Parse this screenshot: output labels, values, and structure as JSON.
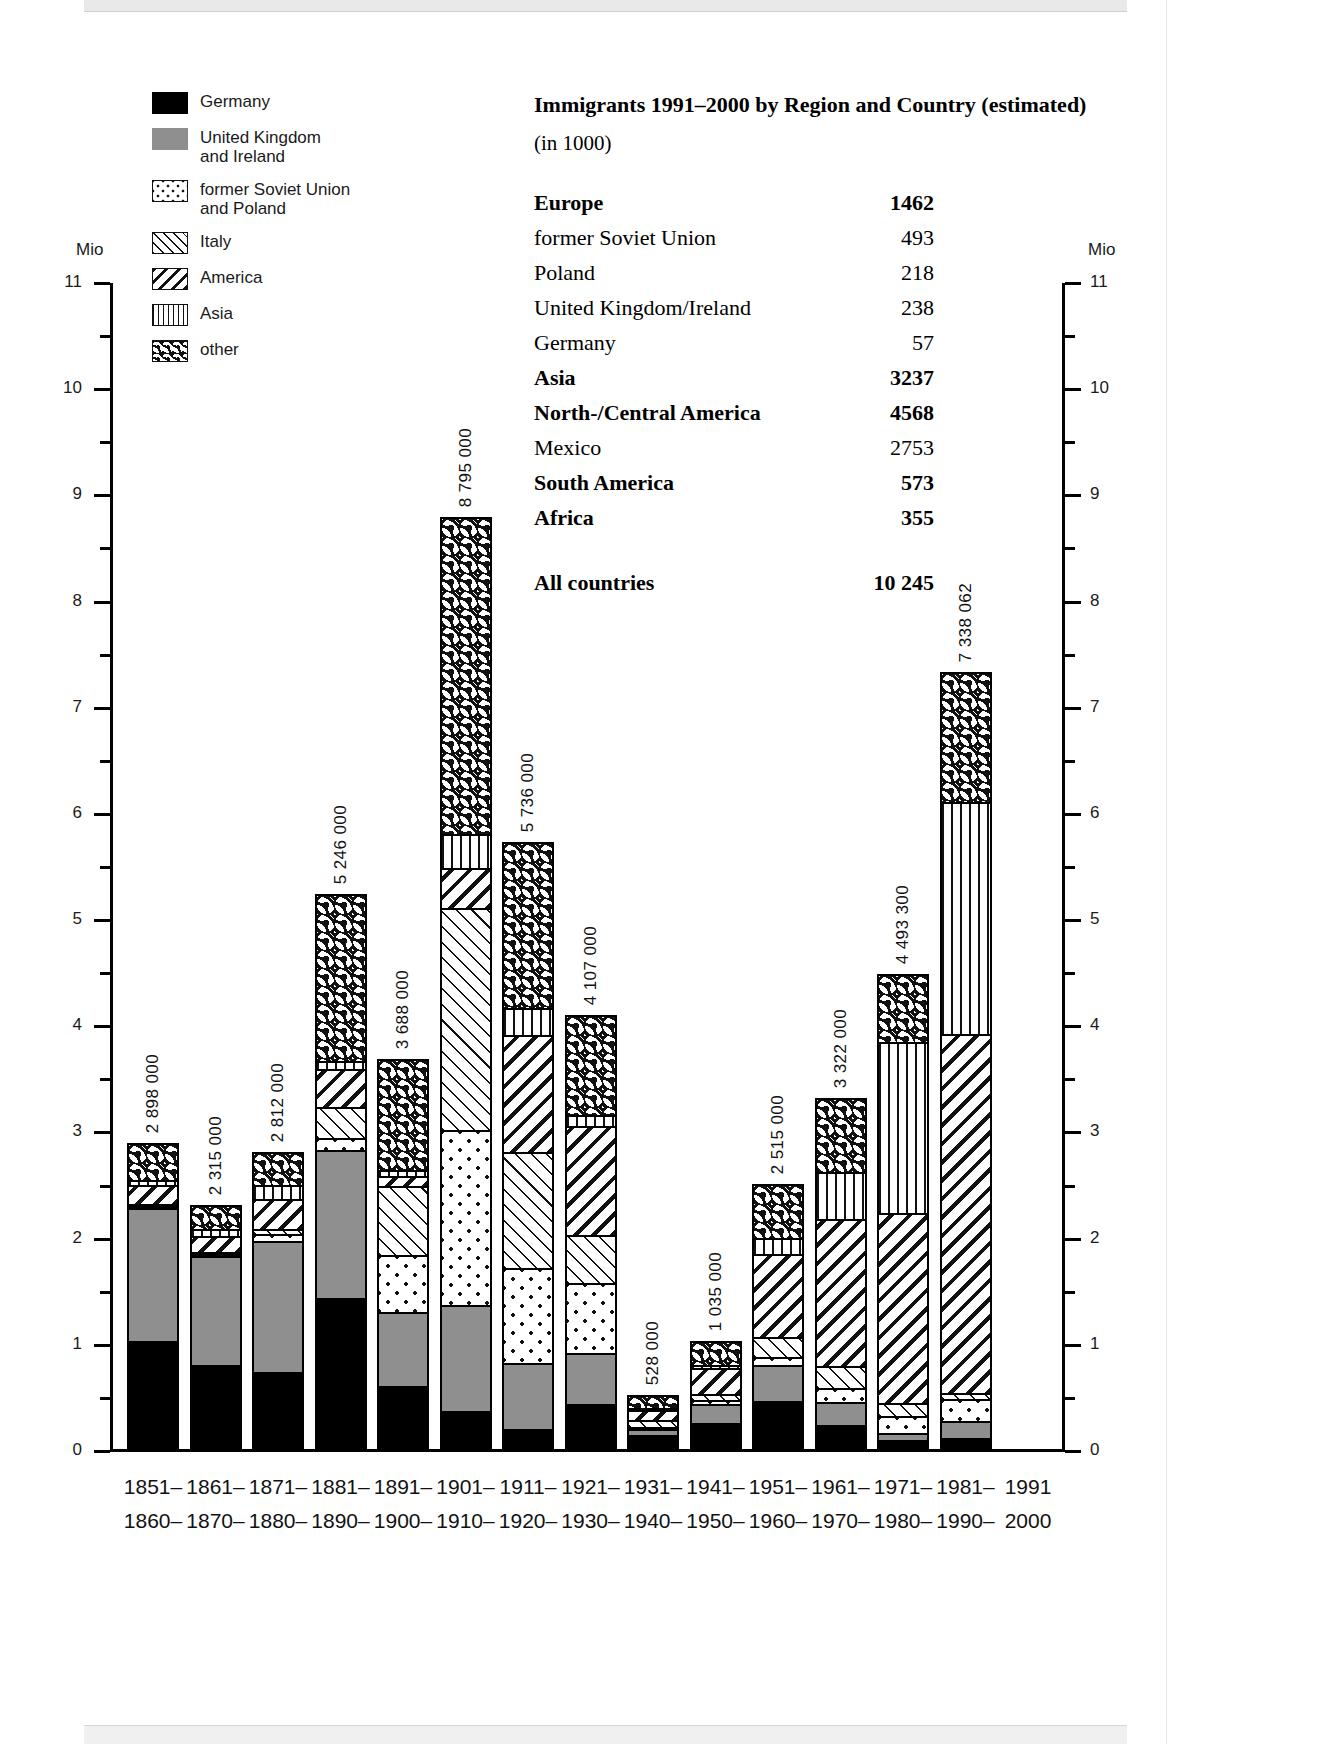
{
  "legend": {
    "items": [
      {
        "label": "Germany",
        "pattern": "solid-black",
        "key": "germany"
      },
      {
        "label": "United Kingdom\nand Ireland",
        "pattern": "solid-grey",
        "key": "uk"
      },
      {
        "label": "former Soviet Union\nand Poland",
        "pattern": "dotted",
        "key": "soviet"
      },
      {
        "label": "Italy",
        "pattern": "fine-diagonal-hatch",
        "key": "italy"
      },
      {
        "label": "America",
        "pattern": "bold-diagonal-hatch",
        "key": "america"
      },
      {
        "label": "Asia",
        "pattern": "vertical-lines",
        "key": "asia"
      },
      {
        "label": "other",
        "pattern": "wavy",
        "key": "other"
      }
    ]
  },
  "table": {
    "title": "Immigrants 1991–2000 by Region and Country (estimated)",
    "subtitle": "(in 1000)",
    "rows": [
      {
        "name": "Europe",
        "value": "1462",
        "bold": true
      },
      {
        "name": "former Soviet Union",
        "value": "493",
        "bold": false
      },
      {
        "name": "Poland",
        "value": "218",
        "bold": false
      },
      {
        "name": "United Kingdom/Ireland",
        "value": "238",
        "bold": false
      },
      {
        "name": "Germany",
        "value": "57",
        "bold": false
      },
      {
        "name": "Asia",
        "value": "3237",
        "bold": true
      },
      {
        "name": "North-/Central America",
        "value": "4568",
        "bold": true
      },
      {
        "name": "Mexico",
        "value": "2753",
        "bold": false
      },
      {
        "name": "South America",
        "value": "573",
        "bold": true
      },
      {
        "name": "Africa",
        "value": "355",
        "bold": true
      }
    ],
    "total": {
      "name": "All countries",
      "value": "10 245",
      "bold": true
    }
  },
  "axes": {
    "unit_left": "Mio",
    "unit_right": "Mio",
    "ticks": [
      "0",
      "1",
      "2",
      "3",
      "4",
      "5",
      "6",
      "7",
      "8",
      "9",
      "10",
      "11"
    ],
    "ymin": 0,
    "ymax": 11
  },
  "chart_data": {
    "type": "bar",
    "stacked": true,
    "xlabel": "",
    "ylabel": "Mio",
    "ylim": [
      0,
      11
    ],
    "grid": false,
    "legend_position": "top-left",
    "unit_note": "values in persons; axis in millions",
    "categories": [
      "1851–1860",
      "1861–1870",
      "1871–1880",
      "1881–1890",
      "1891–1900",
      "1901–1910",
      "1911–1920",
      "1921–1930",
      "1931–1940",
      "1941–1950",
      "1951–1960",
      "1961–1970",
      "1971–1980",
      "1981–1990",
      "1991–2000"
    ],
    "category_labels_top": [
      "1851–",
      "1861–",
      "1871–",
      "1881–",
      "1891–",
      "1901–",
      "1911–",
      "1921–",
      "1931–",
      "1941–",
      "1951–",
      "1961–",
      "1971–",
      "1981–",
      "1991"
    ],
    "category_labels_bottom": [
      "1860–",
      "1870–",
      "1880–",
      "1890–",
      "1900–",
      "1910–",
      "1920–",
      "1930–",
      "1940–",
      "1950–",
      "1960–",
      "1970–",
      "1980–",
      "1990–",
      "2000"
    ],
    "totals_labels": [
      "2 898 000",
      "2 315 000",
      "2 812 000",
      "5 246 000",
      "3 688 000",
      "8 795 000",
      "5 736 000",
      "4 107 000",
      "528 000",
      "1 035 000",
      "2 515 000",
      "3 322 000",
      "4 493 300",
      "7 338 062",
      ""
    ],
    "totals": [
      2898000,
      2315000,
      2812000,
      5246000,
      3688000,
      8795000,
      5736000,
      4107000,
      528000,
      1035000,
      2515000,
      3322000,
      4493300,
      7338062,
      0
    ],
    "series": [
      {
        "name": "Germany",
        "key": "germany",
        "values": [
          1010000,
          790000,
          720000,
          1410000,
          580000,
          340000,
          170000,
          410000,
          120000,
          230000,
          440000,
          210000,
          70000,
          90000,
          0
        ]
      },
      {
        "name": "United Kingdom and Ireland",
        "key": "uk",
        "values": [
          1280000,
          1050000,
          1250000,
          1410000,
          700000,
          1000000,
          630000,
          480000,
          60000,
          190000,
          340000,
          220000,
          60000,
          160000,
          0
        ]
      },
      {
        "name": "former Soviet Union and Poland",
        "key": "soviet",
        "values": [
          20000,
          10000,
          60000,
          110000,
          550000,
          1660000,
          900000,
          670000,
          20000,
          40000,
          80000,
          130000,
          160000,
          200000,
          0
        ]
      },
      {
        "name": "Italy",
        "key": "italy",
        "values": [
          10000,
          10000,
          50000,
          300000,
          650000,
          2100000,
          1100000,
          460000,
          70000,
          60000,
          190000,
          210000,
          130000,
          60000,
          0
        ]
      },
      {
        "name": "America",
        "key": "america",
        "values": [
          180000,
          160000,
          290000,
          360000,
          100000,
          380000,
          1110000,
          1030000,
          110000,
          250000,
          800000,
          1400000,
          1800000,
          3400000,
          0
        ]
      },
      {
        "name": "Asia",
        "key": "asia",
        "values": [
          45000,
          70000,
          130000,
          70000,
          60000,
          320000,
          250000,
          110000,
          20000,
          35000,
          150000,
          450000,
          1630000,
          2200000,
          0
        ]
      },
      {
        "name": "other",
        "key": "other",
        "values": [
          353000,
          225000,
          312000,
          1586000,
          1048000,
          2995000,
          1576000,
          947000,
          128000,
          230000,
          515000,
          702000,
          643300,
          1228062,
          0
        ]
      }
    ]
  }
}
